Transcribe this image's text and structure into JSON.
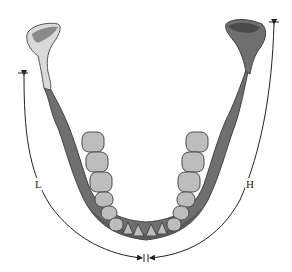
{
  "diagram": {
    "labels": {
      "left_arc": "L",
      "right_arc": "H"
    },
    "colors": {
      "bone": "#6f6f6f",
      "bone_dark": "#4a4a4a",
      "bone_light": "#8a8a8a",
      "condyle_left_light": "#d9d9d9",
      "tooth": "#bdbdbd",
      "tooth_outline": "#4a4a4a",
      "line": "#222222"
    },
    "measurements": [
      {
        "id": "L",
        "side": "left",
        "from": "left ramus top marker",
        "to": "midline marker"
      },
      {
        "id": "H",
        "side": "right",
        "from": "right condyle top marker",
        "to": "midline marker"
      }
    ]
  }
}
